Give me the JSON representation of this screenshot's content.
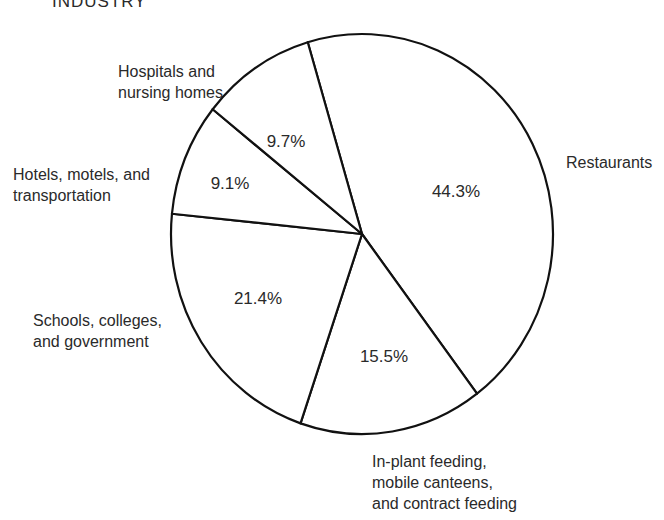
{
  "chart_data": {
    "type": "pie",
    "title": "INDUSTRY",
    "slices": [
      {
        "label": "Restaurants",
        "label_lines": [
          "Restaurants"
        ],
        "value": 44.3,
        "value_label": "44.3%"
      },
      {
        "label": "In-plant feeding, mobile canteens, and contract feeding",
        "label_lines": [
          "In-plant feeding,",
          "mobile canteens,",
          "and contract feeding"
        ],
        "value": 15.5,
        "value_label": "15.5%"
      },
      {
        "label": "Schools, colleges, and government",
        "label_lines": [
          "Schools, colleges,",
          "and government"
        ],
        "value": 21.4,
        "value_label": "21.4%"
      },
      {
        "label": "Hotels, motels, and transportation",
        "label_lines": [
          "Hotels, motels, and",
          "transportation"
        ],
        "value": 9.1,
        "value_label": "9.1%"
      },
      {
        "label": "Hospitals and nursing homes",
        "label_lines": [
          "Hospitals and",
          "nursing homes"
        ],
        "value": 9.7,
        "value_label": "9.7%"
      }
    ],
    "legend": "none",
    "colors": {
      "stroke": "#111111",
      "fill": "#ffffff",
      "text": "#2a2a2a"
    }
  }
}
